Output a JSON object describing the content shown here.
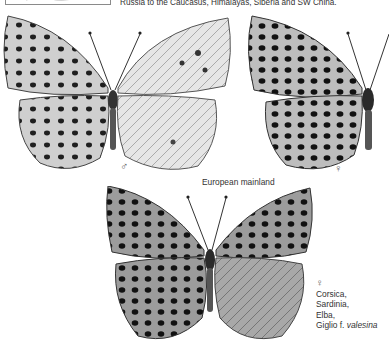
{
  "header": {
    "range_text": "Russia to the Caucasus, Himalayas, Siberia and SW China."
  },
  "figures": {
    "male": {
      "symbol": "♂",
      "description": "male upperside and underside"
    },
    "female_mainland": {
      "symbol": "♀",
      "description": "female upperside"
    },
    "mainland_caption": "European mainland",
    "female_island": {
      "symbol": "♀",
      "lines": [
        "Corsica,",
        "Sardinia,",
        "Elba,"
      ],
      "last_line_prefix": "Giglio f. ",
      "form_name": "valesina"
    }
  }
}
